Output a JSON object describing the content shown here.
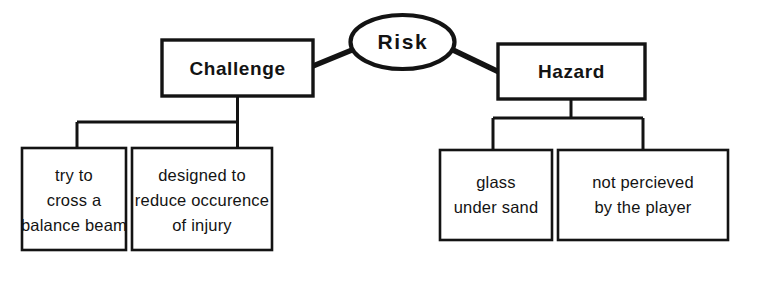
{
  "diagram": {
    "title": "Risk",
    "type": "hierarchy-tree",
    "root": {
      "id": "risk",
      "label": "Risk",
      "shape": "ellipse"
    },
    "branches": [
      {
        "id": "challenge",
        "label": "Challenge",
        "shape": "rectangle",
        "children": [
          {
            "id": "challenge-child-1",
            "shape": "rectangle",
            "lines": [
              "try  to",
              "cross a",
              "balance beam"
            ]
          },
          {
            "id": "challenge-child-2",
            "shape": "rectangle",
            "lines": [
              "designed to",
              "reduce occurence",
              "of  injury"
            ]
          }
        ]
      },
      {
        "id": "hazard",
        "label": "Hazard",
        "shape": "rectangle",
        "children": [
          {
            "id": "hazard-child-1",
            "shape": "rectangle",
            "lines": [
              "glass",
              "under sand"
            ]
          },
          {
            "id": "hazard-child-2",
            "shape": "rectangle",
            "lines": [
              "not percieved",
              "by the player"
            ]
          }
        ]
      }
    ],
    "colors": {
      "stroke": "#131313",
      "fill": "#ffffff",
      "text": "#131313",
      "background": "#ffffff"
    }
  }
}
